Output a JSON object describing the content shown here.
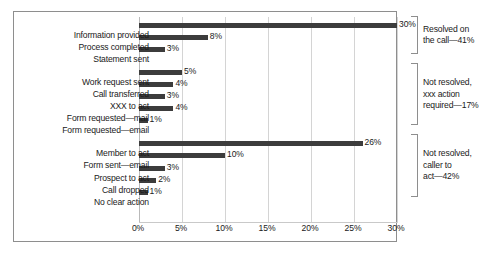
{
  "chart_data": {
    "type": "bar",
    "orientation": "horizontal",
    "title": "",
    "xlabel": "",
    "ylabel": "",
    "xlim": [
      0,
      30
    ],
    "xticks": [
      0,
      5,
      10,
      15,
      20,
      25,
      30
    ],
    "xtick_labels": [
      "0%",
      "5%",
      "10%",
      "15%",
      "20%",
      "25%",
      "30%"
    ],
    "grid": true,
    "legend": "none",
    "bar_color": "#3c3c3c",
    "categories": [
      "Information provided",
      "Process completed",
      "Statement sent",
      "Work request sent",
      "Call transferred",
      "XXX to act",
      "Form requested—mail",
      "Form requested—email",
      "Member to act",
      "Form sent—email",
      "Prospect to act",
      "Call dropped",
      "No clear action"
    ],
    "values": [
      30,
      8,
      3,
      5,
      4,
      3,
      4,
      1,
      26,
      10,
      3,
      2,
      1
    ],
    "value_labels": [
      "30%",
      "8%",
      "3%",
      "5%",
      "4%",
      "3%",
      "4%",
      "1%",
      "26%",
      "10%",
      "3%",
      "2%",
      "1%"
    ],
    "groups": [
      {
        "label": "Resolved on the call—41%",
        "label_lines": [
          "Resolved on",
          "the call—41%"
        ],
        "categories": [
          0,
          1,
          2
        ],
        "total": 41
      },
      {
        "label": "Not resolved, xxx action required—17%",
        "label_lines": [
          "Not resolved,",
          "xxx action",
          "required—17%"
        ],
        "categories": [
          3,
          4,
          5,
          6,
          7
        ],
        "total": 17
      },
      {
        "label": "Not resolved, caller to act—42%",
        "label_lines": [
          "Not resolved,",
          "caller to",
          "act—42%"
        ],
        "categories": [
          8,
          9,
          10,
          11,
          12
        ],
        "total": 42
      }
    ]
  },
  "rows": [
    {
      "label": "Information provided",
      "value": 30,
      "value_label": "30%"
    },
    {
      "label": "Process completed",
      "value": 8,
      "value_label": "8%"
    },
    {
      "label": "Statement sent",
      "value": 3,
      "value_label": "3%"
    },
    {
      "label": "Work request sent",
      "value": 5,
      "value_label": "5%"
    },
    {
      "label": "Call transferred",
      "value": 4,
      "value_label": "4%"
    },
    {
      "label": "XXX to act",
      "value": 3,
      "value_label": "3%"
    },
    {
      "label": "Form requested—mail",
      "value": 4,
      "value_label": "4%"
    },
    {
      "label": "Form requested—email",
      "value": 1,
      "value_label": "1%"
    },
    {
      "label": "Member to act",
      "value": 26,
      "value_label": "26%"
    },
    {
      "label": "Form sent—email",
      "value": 10,
      "value_label": "10%"
    },
    {
      "label": "Prospect to act",
      "value": 3,
      "value_label": "3%"
    },
    {
      "label": "Call dropped",
      "value": 2,
      "value_label": "2%"
    },
    {
      "label": "No clear action",
      "value": 1,
      "value_label": "1%"
    }
  ],
  "ticks": [
    {
      "label": "0%",
      "value": 0
    },
    {
      "label": "5%",
      "value": 5
    },
    {
      "label": "10%",
      "value": 10
    },
    {
      "label": "15%",
      "value": 15
    },
    {
      "label": "20%",
      "value": 20
    },
    {
      "label": "25%",
      "value": 25
    },
    {
      "label": "30%",
      "value": 30
    }
  ],
  "annotations": [
    {
      "line1": "Resolved on",
      "line2": "the call—41%",
      "line3": ""
    },
    {
      "line1": "Not resolved,",
      "line2": "xxx action",
      "line3": "required—17%"
    },
    {
      "line1": "Not resolved,",
      "line2": "caller to",
      "line3": "act—42%"
    }
  ]
}
